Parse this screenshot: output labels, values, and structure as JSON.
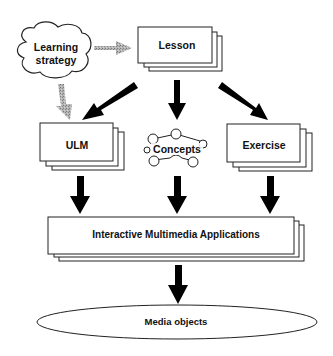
{
  "diagram": {
    "nodes": {
      "learning_strategy": {
        "line1": "Learning",
        "line2": "strategy",
        "shape": "cloud"
      },
      "lesson": {
        "label": "Lesson",
        "shape": "stacked-pages"
      },
      "ulm": {
        "label": "ULM",
        "shape": "stacked-pages"
      },
      "concepts": {
        "label": "Concepts",
        "shape": "concept-network"
      },
      "exercise": {
        "label": "Exercise",
        "shape": "stacked-pages"
      },
      "ima": {
        "label": "Interactive Multimedia Applications",
        "shape": "stacked-pages"
      },
      "media": {
        "label": "Media objects",
        "shape": "ellipse"
      }
    },
    "edges": [
      {
        "from": "learning_strategy",
        "to": "lesson",
        "style": "gray-dotted"
      },
      {
        "from": "learning_strategy",
        "to": "ulm",
        "style": "gray-dotted"
      },
      {
        "from": "lesson",
        "to": "ulm",
        "style": "black"
      },
      {
        "from": "lesson",
        "to": "concepts",
        "style": "black"
      },
      {
        "from": "lesson",
        "to": "exercise",
        "style": "black"
      },
      {
        "from": "ulm",
        "to": "ima",
        "style": "black"
      },
      {
        "from": "concepts",
        "to": "ima",
        "style": "black"
      },
      {
        "from": "exercise",
        "to": "ima",
        "style": "black"
      },
      {
        "from": "ima",
        "to": "media",
        "style": "black"
      }
    ],
    "colors": {
      "arrow": "#000000",
      "gray_arrow": "#9a9a9a",
      "stroke": "#222222"
    }
  }
}
